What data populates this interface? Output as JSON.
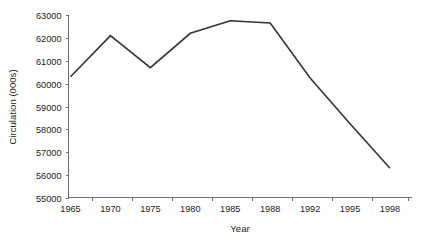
{
  "chart_data": {
    "type": "line",
    "title": "",
    "xlabel": "Year",
    "ylabel": "Circulation (000s)",
    "categories": [
      "1965",
      "1970",
      "1975",
      "1980",
      "1985",
      "1988",
      "1992",
      "1995",
      "1998"
    ],
    "values": [
      60300,
      62100,
      60700,
      62200,
      62750,
      62650,
      60250,
      58250,
      56300
    ],
    "series": [
      {
        "name": "Circulation",
        "color": "#333333",
        "values": [
          60300,
          62100,
          60700,
          62200,
          62750,
          62650,
          60250,
          58250,
          56300
        ]
      }
    ],
    "ylim": [
      55000,
      63000
    ],
    "ytick_step": 1000,
    "ytick_labels": [
      "55000",
      "56000",
      "57000",
      "58000",
      "59000",
      "60000",
      "61000",
      "62000",
      "63000"
    ],
    "grid": false,
    "legend": false,
    "legend_position": "none",
    "axis_color": "#6e6e6e",
    "line_color": "#333333",
    "background": "#ffffff"
  }
}
